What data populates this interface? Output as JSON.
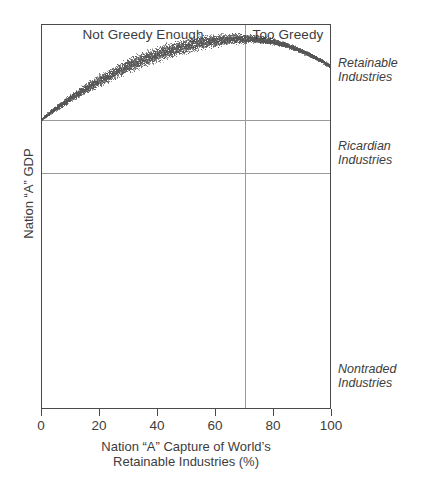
{
  "figure": {
    "background_color": "#ffffff",
    "frame_color": "#4a4a4a",
    "grid_color": "#9a9a9a",
    "dot_color": "#555555"
  },
  "chart_data": {
    "type": "scatter",
    "title": "",
    "xlabel_line1": "Nation “A” Capture of World’s",
    "xlabel_line2": "Retainable Industries (%)",
    "ylabel": "Nation “A” GDP",
    "xlim": [
      0,
      100
    ],
    "ylim": [
      0,
      100
    ],
    "grid": true,
    "xticks": [
      0,
      20,
      40,
      60,
      80,
      100
    ],
    "xtick_labels": [
      "0",
      "20",
      "40",
      "60",
      "80",
      "100"
    ],
    "yticks": [],
    "ytick_labels": [],
    "legend_position": "right",
    "annotations": [
      {
        "name": "not-greedy-enough",
        "text": "Not Greedy Enough",
        "x_range": [
          0,
          70
        ],
        "position": "top-inside"
      },
      {
        "name": "too-greedy",
        "text": "Too Greedy",
        "x_range": [
          70,
          100
        ],
        "position": "top-inside"
      },
      {
        "name": "retainable-industries",
        "text_line1": "Retainable",
        "text_line2": "Industries",
        "y_value": 83,
        "position": "right-outside"
      },
      {
        "name": "ricardian-industries",
        "text_line1": "Ricardian",
        "text_line2": "Industries",
        "y_value": 64,
        "position": "right-outside"
      },
      {
        "name": "nontraded-industries",
        "text_line1": "Nontraded",
        "text_line2": "Industries",
        "y_value": 12,
        "position": "right-outside"
      }
    ],
    "vertical_divider": {
      "x": 70,
      "label": "greed-threshold"
    },
    "horizontal_gridlines": [
      {
        "y": 75.3,
        "label": "retainable-ricardian-boundary"
      },
      {
        "y": 61.6,
        "label": "ricardian-nontraded-boundary"
      }
    ],
    "series": [
      {
        "name": "Nation A GDP curve",
        "style": "stippled-band",
        "description": "Inverted-U band of scattered dots; rises from left boundary, peaks near 70% capture, declines to the right edge.",
        "x": [
          0,
          5,
          10,
          15,
          20,
          25,
          30,
          35,
          40,
          45,
          50,
          55,
          60,
          65,
          70,
          75,
          80,
          85,
          90,
          95,
          100
        ],
        "y": [
          75.3,
          78.2,
          80.8,
          83.2,
          85.4,
          87.4,
          89.2,
          90.8,
          92.2,
          93.4,
          94.4,
          95.2,
          95.8,
          96.2,
          96.3,
          96.1,
          95.5,
          94.5,
          93.0,
          91.2,
          89.0
        ],
        "band_halfwidth": [
          0.4,
          0.9,
          1.3,
          1.7,
          2.0,
          2.3,
          2.5,
          2.6,
          2.7,
          2.7,
          2.6,
          2.4,
          2.2,
          1.9,
          1.6,
          1.3,
          1.1,
          0.9,
          0.8,
          0.7,
          0.6
        ]
      }
    ]
  },
  "header": {
    "left_region_label": "Not Greedy Enough",
    "right_region_label": "Too Greedy"
  },
  "side_labels": {
    "retainable": {
      "line1": "Retainable",
      "line2": "Industries"
    },
    "ricardian": {
      "line1": "Ricardian",
      "line2": "Industries"
    },
    "nontraded": {
      "line1": "Nontraded",
      "line2": "Industries"
    }
  },
  "axes": {
    "x_title_line1": "Nation “A” Capture of World’s",
    "x_title_line2": "Retainable Industries (%)",
    "y_title": "Nation “A” GDP"
  }
}
